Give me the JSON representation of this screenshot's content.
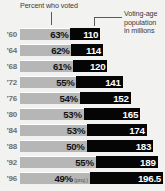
{
  "header": {
    "left_label": "Percent who voted",
    "right_label_lines": [
      "Voting-age",
      "population",
      "in millions"
    ]
  },
  "chart_data": {
    "type": "bar",
    "title": "",
    "xlabel": "",
    "ylabel": "",
    "categories": [
      "'60",
      "'64",
      "'68",
      "'72",
      "'76",
      "'80",
      "'84",
      "'88",
      "'92",
      "'96"
    ],
    "series": [
      {
        "name": "Percent who voted",
        "unit": "%",
        "values": [
          63,
          62,
          61,
          55,
          54,
          53,
          53,
          50,
          55,
          49
        ]
      },
      {
        "name": "Voting-age population in millions",
        "unit": "millions",
        "values": [
          110,
          114,
          120,
          141,
          152,
          165,
          174,
          183,
          189,
          196.5
        ]
      }
    ],
    "rows": [
      {
        "year": "'60",
        "pct_label": "63%",
        "pop_label": "110",
        "pct": 63,
        "pop": 110,
        "note": ""
      },
      {
        "year": "'64",
        "pct_label": "62%",
        "pop_label": "114",
        "pct": 62,
        "pop": 114,
        "note": ""
      },
      {
        "year": "'68",
        "pct_label": "61%",
        "pop_label": "120",
        "pct": 61,
        "pop": 120,
        "note": ""
      },
      {
        "year": "'72",
        "pct_label": "55%",
        "pop_label": "141",
        "pct": 55,
        "pop": 141,
        "note": ""
      },
      {
        "year": "'76",
        "pct_label": "54%",
        "pop_label": "152",
        "pct": 54,
        "pop": 152,
        "note": ""
      },
      {
        "year": "'80",
        "pct_label": "53%",
        "pop_label": "165",
        "pct": 53,
        "pop": 165,
        "note": ""
      },
      {
        "year": "'84",
        "pct_label": "53%",
        "pop_label": "174",
        "pct": 53,
        "pop": 174,
        "note": ""
      },
      {
        "year": "'88",
        "pct_label": "50%",
        "pop_label": "183",
        "pct": 50,
        "pop": 183,
        "note": ""
      },
      {
        "year": "'92",
        "pct_label": "55%",
        "pop_label": "189",
        "pct": 55,
        "pop": 189,
        "note": ""
      },
      {
        "year": "'96",
        "pct_label": "49%",
        "pop_label": "196.5",
        "pct": 49,
        "pop": 196.5,
        "note": "(proj.)"
      }
    ],
    "legend": [
      "Percent who voted",
      "Voting-age population in millions"
    ],
    "grid": false,
    "colors": {
      "voted_segment": "#b6b6b6",
      "nonvoter_segment": "#050505",
      "background": "#f2f2f0",
      "year_text": "#6e6e6e"
    }
  }
}
